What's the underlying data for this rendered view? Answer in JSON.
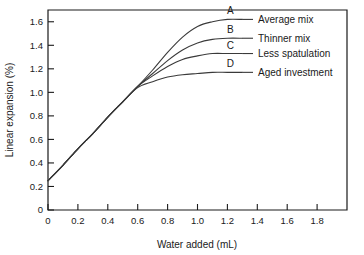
{
  "chart_data": {
    "type": "line",
    "title": "",
    "xlabel": "Water added (mL)",
    "ylabel": "Linear expansion (%)",
    "xlim": [
      0,
      2.0
    ],
    "ylim": [
      0,
      1.7
    ],
    "xticks": [
      "0",
      "0.2",
      "0.4",
      "0.6",
      "0.8",
      "1.0",
      "1.2",
      "1.4",
      "1.6",
      "1.8"
    ],
    "xtick_values": [
      0,
      0.2,
      0.4,
      0.6,
      0.8,
      1.0,
      1.2,
      1.4,
      1.6,
      1.8
    ],
    "yticks": [
      "0",
      "0.2",
      "0.4",
      "0.6",
      "0.8",
      "1.0",
      "1.2",
      "1.4",
      "1.6"
    ],
    "ytick_values": [
      0,
      0.2,
      0.4,
      0.6,
      0.8,
      1.0,
      1.2,
      1.4,
      1.6
    ],
    "grid": false,
    "legend_position": "inline-right-labels",
    "series": [
      {
        "key": "A",
        "name": "Average mix",
        "x": [
          0.0,
          0.1,
          0.2,
          0.3,
          0.4,
          0.5,
          0.6,
          0.7,
          0.8,
          0.9,
          1.0,
          1.1,
          1.2,
          1.3
        ],
        "values": [
          0.25,
          0.38,
          0.52,
          0.65,
          0.79,
          0.92,
          1.05,
          1.19,
          1.34,
          1.47,
          1.56,
          1.6,
          1.62,
          1.62
        ]
      },
      {
        "key": "B",
        "name": "Thinner mix",
        "x": [
          0.0,
          0.1,
          0.2,
          0.3,
          0.4,
          0.5,
          0.6,
          0.7,
          0.8,
          0.9,
          1.0,
          1.1,
          1.2,
          1.3
        ],
        "values": [
          0.25,
          0.38,
          0.52,
          0.65,
          0.79,
          0.92,
          1.05,
          1.16,
          1.27,
          1.36,
          1.42,
          1.45,
          1.46,
          1.46
        ]
      },
      {
        "key": "C",
        "name": "Less spatulation",
        "x": [
          0.0,
          0.1,
          0.2,
          0.3,
          0.4,
          0.5,
          0.6,
          0.7,
          0.8,
          0.9,
          1.0,
          1.1,
          1.2,
          1.3
        ],
        "values": [
          0.25,
          0.38,
          0.52,
          0.65,
          0.79,
          0.92,
          1.05,
          1.14,
          1.22,
          1.28,
          1.31,
          1.33,
          1.33,
          1.33
        ]
      },
      {
        "key": "D",
        "name": "Aged investment",
        "x": [
          0.0,
          0.1,
          0.2,
          0.3,
          0.4,
          0.5,
          0.6,
          0.7,
          0.8,
          0.9,
          1.0,
          1.1,
          1.2,
          1.3
        ],
        "values": [
          0.25,
          0.38,
          0.52,
          0.65,
          0.79,
          0.92,
          1.04,
          1.09,
          1.13,
          1.15,
          1.16,
          1.17,
          1.17,
          1.17
        ]
      }
    ],
    "annotations": [
      {
        "label": "A",
        "series": "Average mix"
      },
      {
        "label": "B",
        "series": "Thinner mix"
      },
      {
        "label": "C",
        "series": "Less spatulation"
      },
      {
        "label": "D",
        "series": "Aged investment"
      }
    ]
  }
}
